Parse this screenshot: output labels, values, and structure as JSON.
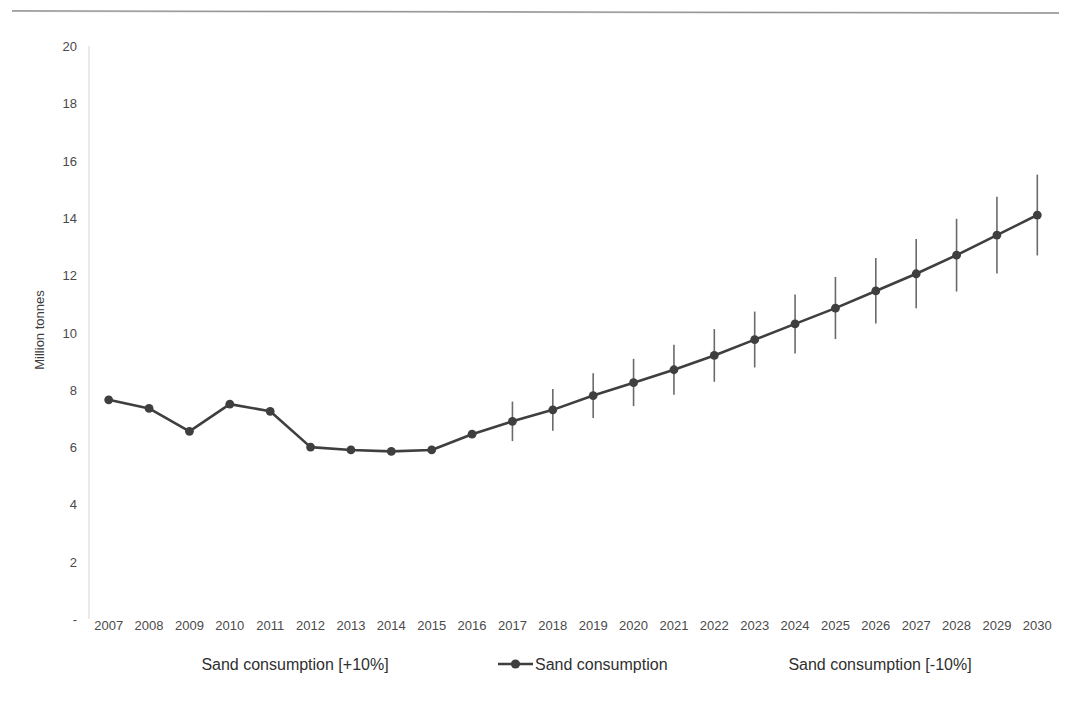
{
  "chart_data": {
    "type": "line",
    "title": "",
    "xlabel": "",
    "ylabel": "Million tonnes",
    "ylim": [
      0,
      20
    ],
    "ytick_values": [
      0,
      2,
      4,
      6,
      8,
      10,
      12,
      14,
      16,
      18,
      20
    ],
    "ytick_labels": [
      "-",
      "2",
      "4",
      "6",
      "8",
      "10",
      "12",
      "14",
      "16",
      "18",
      "20"
    ],
    "grid": false,
    "legend_position": "bottom",
    "categories": [
      "2007",
      "2008",
      "2009",
      "2010",
      "2011",
      "2012",
      "2013",
      "2014",
      "2015",
      "2016",
      "2017",
      "2018",
      "2019",
      "2020",
      "2021",
      "2022",
      "2023",
      "2024",
      "2025",
      "2026",
      "2027",
      "2028",
      "2029",
      "2030"
    ],
    "series": [
      {
        "name": "Sand consumption",
        "values": [
          7.65,
          7.35,
          6.55,
          7.5,
          7.25,
          6.0,
          5.9,
          5.85,
          5.9,
          6.45,
          6.9,
          7.3,
          7.8,
          8.25,
          8.7,
          9.2,
          9.75,
          10.3,
          10.85,
          11.45,
          12.05,
          12.7,
          13.4,
          14.1
        ]
      },
      {
        "name": "Sand consumption [+10%]",
        "values": [
          null,
          null,
          null,
          null,
          null,
          null,
          null,
          null,
          null,
          null,
          7.59,
          8.03,
          8.58,
          9.08,
          9.57,
          10.12,
          10.73,
          11.33,
          11.94,
          12.6,
          13.26,
          13.97,
          14.74,
          15.51
        ]
      },
      {
        "name": "Sand consumption [-10%]",
        "values": [
          null,
          null,
          null,
          null,
          null,
          null,
          null,
          null,
          null,
          null,
          6.21,
          6.57,
          7.02,
          7.43,
          7.83,
          8.28,
          8.78,
          9.27,
          9.77,
          10.31,
          10.85,
          11.43,
          12.06,
          12.69
        ]
      }
    ],
    "legend": [
      {
        "label": "Sand consumption [+10%]",
        "marker": "none"
      },
      {
        "label": "Sand consumption",
        "marker": "line-dot"
      },
      {
        "label": "Sand consumption [-10%]",
        "marker": "none"
      }
    ],
    "colors": {
      "line": "#3f3f3f",
      "marker": "#3f3f3f",
      "error_bar": "#6a6a6a",
      "axis": "#d6d6d6",
      "text": "#3b3b3b"
    }
  }
}
